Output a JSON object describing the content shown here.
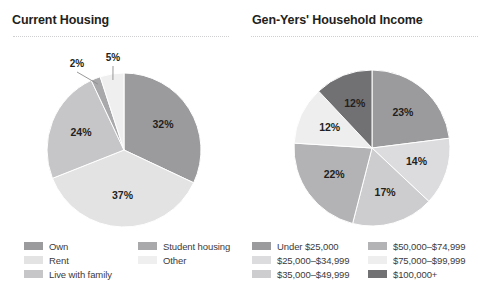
{
  "chart_data": [
    {
      "type": "pie",
      "title": "Current Housing",
      "xlabel": "",
      "ylabel": "",
      "legend_position": "bottom",
      "grid": false,
      "categories": [
        "Own",
        "Rent",
        "Live with family",
        "Student housing",
        "Other"
      ],
      "values": [
        32,
        37,
        24,
        2,
        5
      ],
      "value_labels": [
        "32%",
        "37%",
        "24%",
        "2%",
        "5%"
      ],
      "colors": [
        "#9b9b9e",
        "#e3e3e4",
        "#c6c6c8",
        "#a9a9ac",
        "#efeff0"
      ],
      "callout_slices": [
        "Student housing",
        "Other"
      ]
    },
    {
      "type": "pie",
      "title": "Gen-Yers' Household Income",
      "xlabel": "",
      "ylabel": "",
      "legend_position": "bottom",
      "grid": false,
      "categories": [
        "Under $25,000",
        "$25,000–$34,999",
        "$35,000–$49,999",
        "$50,000–$74,999",
        "$75,000–$99,999",
        "$100,000+"
      ],
      "values": [
        23,
        14,
        17,
        22,
        12,
        12
      ],
      "value_labels": [
        "23%",
        "14%",
        "17%",
        "22%",
        "12%",
        "12%"
      ],
      "colors": [
        "#9b9b9e",
        "#dcdcde",
        "#cdcdcf",
        "#b3b3b6",
        "#eeeeef",
        "#717174"
      ],
      "callout_slices": []
    }
  ],
  "left_panel": {
    "title": "Current Housing",
    "legend": [
      {
        "label": "Own",
        "color": "#9b9b9e"
      },
      {
        "label": "Rent",
        "color": "#e3e3e4"
      },
      {
        "label": "Live with family",
        "color": "#c6c6c8"
      },
      {
        "label": "Student housing",
        "color": "#a9a9ac"
      },
      {
        "label": "Other",
        "color": "#efeff0"
      }
    ],
    "slices": [
      {
        "label": "32%"
      },
      {
        "label": "37%"
      },
      {
        "label": "24%"
      },
      {
        "label": "2%"
      },
      {
        "label": "5%"
      }
    ]
  },
  "right_panel": {
    "title": "Gen-Yers' Household Income",
    "legend": [
      {
        "label": "Under $25,000",
        "color": "#9b9b9e"
      },
      {
        "label": "$25,000–$34,999",
        "color": "#dcdcde"
      },
      {
        "label": "$35,000–$49,999",
        "color": "#cdcdcf"
      },
      {
        "label": "$50,000–$74,999",
        "color": "#b3b3b6"
      },
      {
        "label": "$75,000–$99,999",
        "color": "#eeeeef"
      },
      {
        "label": "$100,000+",
        "color": "#717174"
      }
    ],
    "slices": [
      {
        "label": "23%"
      },
      {
        "label": "14%"
      },
      {
        "label": "17%"
      },
      {
        "label": "22%"
      },
      {
        "label": "12%"
      },
      {
        "label": "12%"
      }
    ]
  }
}
